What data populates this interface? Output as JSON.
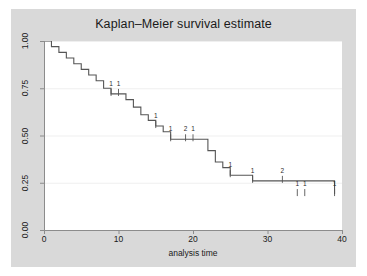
{
  "figure": {
    "background_color": "#ffffff",
    "graph_region_color": "#d9d9d9",
    "plot_area_color": "#ffffff",
    "axis_color": "#8c8c8c",
    "grid_color": "#efefef",
    "curve_color": "#555555",
    "text_color": "#1a1a1a"
  },
  "chart_data": {
    "type": "line",
    "title": "Kaplan–Meier survival estimate",
    "xlabel": "analysis time",
    "ylabel": "",
    "xlim": [
      0,
      40
    ],
    "ylim": [
      0,
      1
    ],
    "xticks": [
      0,
      10,
      20,
      30,
      40
    ],
    "xtick_labels": [
      "0",
      "10",
      "20",
      "30",
      "40"
    ],
    "yticks": [
      0.0,
      0.25,
      0.5,
      0.75,
      1.0
    ],
    "ytick_labels": [
      "0.00",
      "0.25",
      "0.50",
      "0.75",
      "1.00"
    ],
    "grid": "horizontal",
    "legend": "none",
    "step_style": "post",
    "series": [
      {
        "name": "Kaplan-Meier survival estimate",
        "x": [
          0,
          1,
          2,
          3,
          4,
          5,
          6,
          7,
          8,
          9,
          10,
          11,
          12,
          13,
          14,
          15,
          16,
          17,
          18,
          22,
          23,
          24,
          25,
          28,
          33,
          39
        ],
        "y": [
          1.0,
          0.97,
          0.94,
          0.91,
          0.88,
          0.85,
          0.82,
          0.79,
          0.75,
          0.72,
          0.72,
          0.69,
          0.65,
          0.61,
          0.58,
          0.55,
          0.52,
          0.48,
          0.48,
          0.42,
          0.36,
          0.33,
          0.29,
          0.26,
          0.26,
          0.19
        ]
      }
    ],
    "censored": [
      {
        "time": 9,
        "survival": 0.72,
        "count": "1"
      },
      {
        "time": 10,
        "survival": 0.72,
        "count": "1"
      },
      {
        "time": 15,
        "survival": 0.55,
        "count": "1"
      },
      {
        "time": 17,
        "survival": 0.48,
        "count": "1"
      },
      {
        "time": 19,
        "survival": 0.48,
        "count": "2"
      },
      {
        "time": 20,
        "survival": 0.48,
        "count": "1"
      },
      {
        "time": 25,
        "survival": 0.29,
        "count": "1"
      },
      {
        "time": 28,
        "survival": 0.26,
        "count": "1"
      },
      {
        "time": 32,
        "survival": 0.26,
        "count": "2"
      },
      {
        "time": 34,
        "survival": 0.19,
        "count": "1"
      },
      {
        "time": 35,
        "survival": 0.19,
        "count": "1"
      },
      {
        "time": 39,
        "survival": 0.19,
        "count": "1"
      }
    ]
  }
}
